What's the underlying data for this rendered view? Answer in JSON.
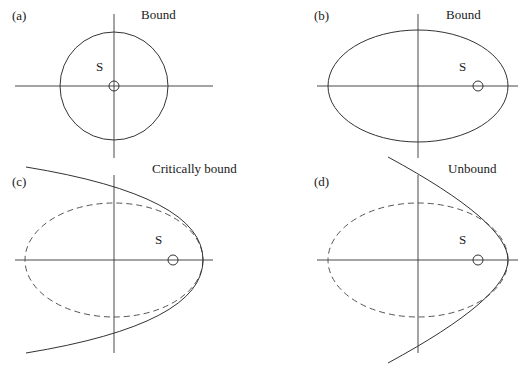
{
  "panels": [
    {
      "id": "a",
      "tag": "(a)",
      "title": "Bound",
      "body_label": "S",
      "orbit_type": "circle",
      "orbit": {
        "cx": 114,
        "cy": 86,
        "rx": 54,
        "ry": 54
      },
      "body": {
        "cx": 114,
        "cy": 86,
        "r": 5
      },
      "axes": {
        "h": [
          15,
          86,
          213,
          86
        ],
        "v": [
          114,
          14,
          114,
          158
        ]
      }
    },
    {
      "id": "b",
      "tag": "(b)",
      "title": "Bound",
      "body_label": "S",
      "orbit_type": "ellipse",
      "orbit": {
        "cx": 418,
        "cy": 86,
        "rx": 90,
        "ry": 56
      },
      "body": {
        "cx": 478,
        "cy": 86,
        "r": 5
      },
      "axes": {
        "h": [
          317,
          86,
          518,
          86
        ],
        "v": [
          418,
          14,
          418,
          158
        ]
      }
    },
    {
      "id": "c",
      "tag": "(c)",
      "title": "Critically bound",
      "body_label": "S",
      "orbit_type": "parabola",
      "reference_ellipse": {
        "cx": 114,
        "cy": 260,
        "rx": 89,
        "ry": 57,
        "style": "dashed"
      },
      "body": {
        "cx": 173,
        "cy": 260,
        "r": 5
      },
      "axes": {
        "h": [
          15,
          260,
          213,
          260
        ],
        "v": [
          114,
          175,
          114,
          353
        ]
      }
    },
    {
      "id": "d",
      "tag": "(d)",
      "title": "Unbound",
      "body_label": "S",
      "orbit_type": "hyperbola",
      "reference_ellipse": {
        "cx": 418,
        "cy": 260,
        "rx": 90,
        "ry": 57,
        "style": "dashed"
      },
      "body": {
        "cx": 478,
        "cy": 260,
        "r": 5
      },
      "axes": {
        "h": [
          317,
          260,
          518,
          260
        ],
        "v": [
          418,
          175,
          418,
          353
        ]
      }
    }
  ]
}
